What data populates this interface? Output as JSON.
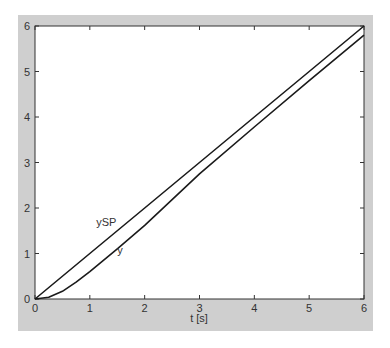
{
  "chart_data": {
    "type": "line",
    "title": "",
    "xlabel": "t [s]",
    "ylabel": "",
    "xlim": [
      0,
      6
    ],
    "ylim": [
      0,
      6
    ],
    "xticks": [
      0,
      1,
      2,
      3,
      4,
      5,
      6
    ],
    "yticks": [
      0,
      1,
      2,
      3,
      4,
      5,
      6
    ],
    "grid": false,
    "legend": "none (inline labels)",
    "annotations": [
      {
        "text": "ySP",
        "x": 1.3,
        "y": 1.6
      },
      {
        "text": "y",
        "x": 1.55,
        "y": 1.0
      }
    ],
    "series": [
      {
        "name": "ySP",
        "x": [
          0,
          1,
          2,
          3,
          4,
          5,
          6
        ],
        "values": [
          0,
          1,
          2,
          3,
          4,
          5,
          6
        ]
      },
      {
        "name": "y",
        "x": [
          0,
          0.25,
          0.5,
          0.75,
          1,
          1.5,
          2,
          3,
          4,
          5,
          6
        ],
        "values": [
          0,
          0.04,
          0.17,
          0.37,
          0.6,
          1.1,
          1.62,
          2.75,
          3.78,
          4.8,
          5.8
        ]
      }
    ],
    "colors": {
      "line": "#1a1a1a",
      "figure_bg": "#cfcfcf",
      "axes_bg": "#ffffff"
    }
  }
}
